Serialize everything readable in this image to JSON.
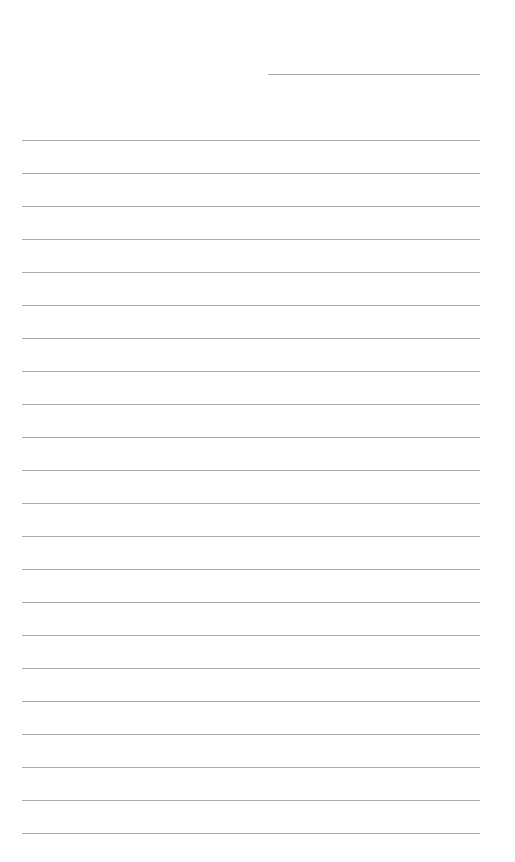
{
  "page": {
    "type": "blank lined paper",
    "background": "#ffffff",
    "line_color": "#a9a9a9",
    "header_line": {
      "x": 268,
      "y": 74,
      "width": 212
    },
    "rules": {
      "count": 22,
      "x": 22,
      "width": 458,
      "first_y": 140,
      "spacing": 33
    }
  }
}
